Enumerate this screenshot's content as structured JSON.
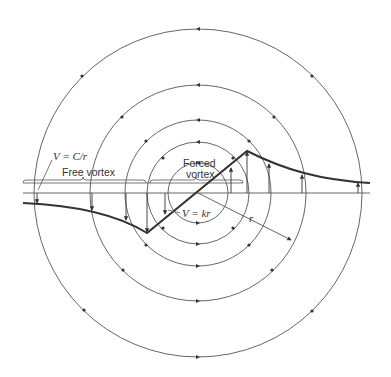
{
  "diagram": {
    "type": "vortex-velocity-profile",
    "center": {
      "x": 198,
      "y": 193
    },
    "circle_radii": [
      30,
      51,
      73,
      108,
      164
    ],
    "flow_direction": "counterclockwise",
    "colors": {
      "line": "#555555",
      "profile": "#333333",
      "text": "#333333",
      "background": "#ffffff"
    },
    "labels": {
      "free_vortex_formula": "V = C/r",
      "free_vortex": "Free vortex",
      "forced_vortex_line1": "Forced",
      "forced_vortex_line2": "vortex",
      "forced_vortex_formula": "V = kr",
      "radius": "r"
    },
    "profile_points": [
      [
        23,
        203
      ],
      [
        60,
        206
      ],
      [
        92,
        211
      ],
      [
        126,
        221
      ],
      [
        147,
        233
      ],
      [
        247,
        151
      ],
      [
        269,
        163
      ],
      [
        302,
        174
      ],
      [
        340,
        180
      ],
      [
        370,
        183
      ]
    ]
  }
}
